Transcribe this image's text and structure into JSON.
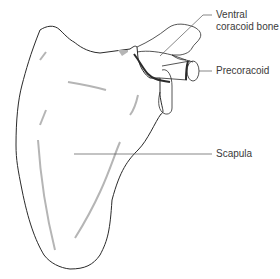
{
  "diagram": {
    "labels": [
      {
        "id": "ventral-coracoid",
        "text_line1": "Ventral",
        "text_line2": "coracoid bone"
      },
      {
        "id": "precoracoid",
        "text": "Precoracoid"
      },
      {
        "id": "scapula",
        "text": "Scapula"
      }
    ],
    "colors": {
      "outline": "#2a2a2a",
      "shading": "#b5b5b5",
      "suture": "#2a2a2a",
      "leader": "#555555",
      "text": "#3a3a3a"
    }
  }
}
